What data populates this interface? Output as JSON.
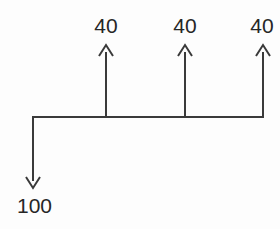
{
  "diagram": {
    "type": "flow-split-diagram",
    "title": "",
    "background_color": "#fdfdfd",
    "line_color": "#3a3a3a",
    "text_color": "#262626",
    "line_width": 2,
    "canvas": {
      "width": 280,
      "height": 229
    },
    "bus_line": {
      "name": "horizontal-bus-line",
      "y": 117,
      "x_start": 32,
      "x_end": 263
    },
    "inflow": {
      "name": "inflow-arrow",
      "label": "100",
      "value": 100,
      "direction": "down",
      "x": 32,
      "y_start": 117,
      "y_end": 188,
      "label_x": 17,
      "label_y": 195
    },
    "outflows": [
      {
        "name": "outflow-arrow-1",
        "label": "40",
        "value": 40,
        "direction": "up",
        "x": 106,
        "y_start": 117,
        "y_end": 45,
        "label_y": 15
      },
      {
        "name": "outflow-arrow-2",
        "label": "40",
        "value": 40,
        "direction": "up",
        "x": 185,
        "y_start": 117,
        "y_end": 45,
        "label_y": 15
      },
      {
        "name": "outflow-arrow-3",
        "label": "40",
        "value": 40,
        "direction": "up",
        "x": 263,
        "y_start": 117,
        "y_end": 45,
        "label_y": 15
      }
    ]
  }
}
